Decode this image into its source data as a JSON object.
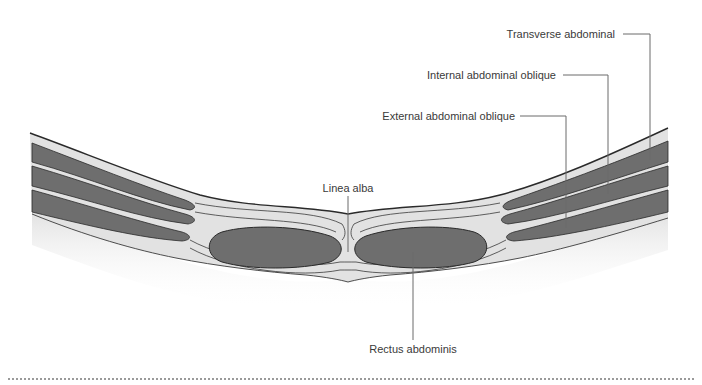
{
  "diagram": {
    "labels": {
      "transverse": "Transverse abdominal",
      "internal_oblique": "Internal abdominal oblique",
      "external_oblique": "External abdominal oblique",
      "linea_alba": "Linea alba",
      "rectus": "Rectus abdominis"
    },
    "colors": {
      "muscle": "#6e6e6e",
      "fascia": "#e2e2e2",
      "outline": "#2a2a2a",
      "leader": "#6b6b6b",
      "text": "#3a3a3a"
    }
  },
  "footer": {
    "separator": "dotted-line"
  }
}
